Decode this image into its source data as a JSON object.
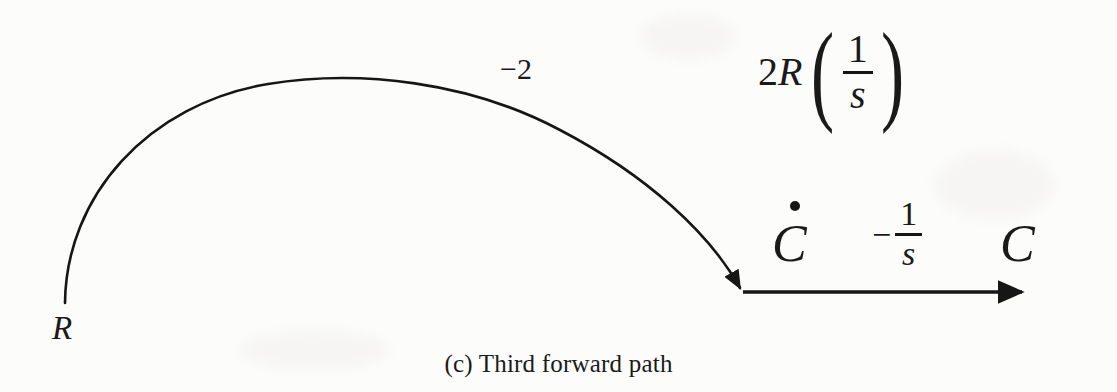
{
  "figure": {
    "caption": "(c) Third forward path",
    "background_color": "#fcfcfb",
    "ink_color": "#161616"
  },
  "nodes": [
    {
      "id": "R",
      "label": "R",
      "x": 65,
      "y": 300
    },
    {
      "id": "Cdot",
      "label": "C",
      "accent": "dot",
      "x": 742,
      "y": 292
    },
    {
      "id": "Cout",
      "label": "C",
      "x": 1030,
      "y": 292
    }
  ],
  "edges": [
    {
      "id": "R-to-Cdot",
      "from": "R",
      "to": "Cdot",
      "gain": "−2",
      "gain_x": 500,
      "gain_y": 54,
      "shape": "arc-over",
      "arrowhead": "down"
    },
    {
      "id": "Cdot-to-C",
      "from": "Cdot",
      "to": "Cout",
      "gain_minus": "−",
      "gain_numerator": "1",
      "gain_denominator": "s",
      "shape": "straight",
      "arrowhead": "right"
    }
  ],
  "annotations": {
    "gain_2Rs": {
      "coefficient_number": "2",
      "coefficient_symbol": "R",
      "paren_open": "(",
      "paren_close": ")",
      "numerator": "1",
      "denominator": "s"
    }
  },
  "graph_data": {
    "type": "signal-flow-graph",
    "title": "(c) Third forward path",
    "node_labels": [
      "R",
      "Ċ",
      "C"
    ],
    "branch_gains": [
      "−2",
      "−1/s"
    ],
    "extra_expression": "2R(1/s)"
  }
}
